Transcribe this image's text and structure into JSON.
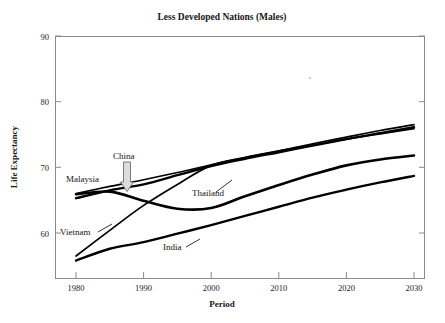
{
  "chart_data": {
    "type": "line",
    "title": "Less Developed Nations (Males)",
    "xlabel": "Period",
    "ylabel": "Life Expectancy",
    "xlim": [
      1980,
      2030
    ],
    "ylim": [
      60,
      90
    ],
    "yaxis_display_min": 55,
    "xticks": [
      "1980",
      "1990",
      "2000",
      "2010",
      "2020",
      "2030"
    ],
    "xtick_values": [
      1980,
      1990,
      2000,
      2010,
      2020,
      2030
    ],
    "yticks": [
      "60",
      "70",
      "80",
      "90"
    ],
    "ytick_values": [
      60,
      70,
      80,
      90
    ],
    "grid": false,
    "legend": "inline-labels",
    "annotations": [
      {
        "label": "China",
        "type": "arrow-callout",
        "points_to_year": 1988
      }
    ],
    "series": [
      {
        "name": "Malaysia",
        "label_position": "left",
        "x": [
          1980,
          1985,
          1990,
          1995,
          2000,
          2005,
          2010,
          2015,
          2020,
          2025,
          2030
        ],
        "values": [
          66.0,
          67.1,
          68.1,
          69.2,
          70.4,
          71.5,
          72.5,
          73.6,
          74.6,
          75.6,
          76.5
        ]
      },
      {
        "name": "China",
        "label_position": "callout",
        "x": [
          1980,
          1985,
          1990,
          1995,
          2000,
          2005,
          2010,
          2015,
          2020,
          2025,
          2030
        ],
        "values": [
          65.3,
          66.5,
          67.4,
          68.8,
          70.2,
          71.3,
          72.3,
          73.3,
          74.3,
          75.2,
          76.1
        ]
      },
      {
        "name": "Vietnam",
        "label_position": "left-low",
        "x": [
          1980,
          1985,
          1990,
          1995,
          2000,
          2005,
          2010,
          2015,
          2020,
          2025,
          2030
        ],
        "values": [
          56.5,
          60.4,
          64.2,
          67.4,
          70.3,
          71.5,
          72.5,
          73.4,
          74.3,
          75.1,
          75.9
        ]
      },
      {
        "name": "Thailand",
        "label_position": "middle",
        "x": [
          1980,
          1985,
          1990,
          1995,
          2000,
          2005,
          2010,
          2015,
          2020,
          2025,
          2030
        ],
        "values": [
          65.9,
          66.3,
          64.9,
          63.7,
          63.8,
          65.6,
          67.3,
          68.9,
          70.3,
          71.2,
          71.8
        ]
      },
      {
        "name": "India",
        "label_position": "bottom",
        "x": [
          1980,
          1985,
          1990,
          1995,
          2000,
          2005,
          2010,
          2015,
          2020,
          2025,
          2030
        ],
        "values": [
          55.8,
          57.6,
          58.6,
          59.9,
          61.2,
          62.6,
          64.0,
          65.4,
          66.6,
          67.7,
          68.7
        ]
      }
    ]
  }
}
